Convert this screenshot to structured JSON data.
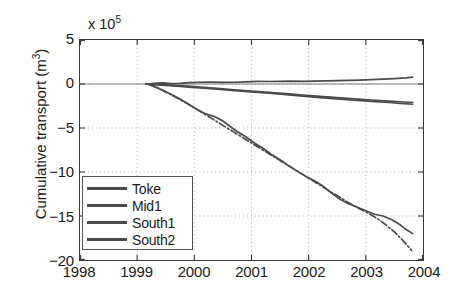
{
  "chart_data": {
    "type": "line",
    "title": "",
    "xlabel": "",
    "ylabel": "Cumulative transport (m3)",
    "ylabel_base": "Cumulative transport (m",
    "ylabel_sup": "3",
    "ylabel_tail": ")",
    "y_multiplier_base": "x 10",
    "y_multiplier_exp": "5",
    "y_multiplier_value": 100000,
    "xlim": [
      1998,
      2004
    ],
    "ylim": [
      -20,
      5
    ],
    "xticks": [
      1998,
      1999,
      2000,
      2001,
      2002,
      2003,
      2004
    ],
    "xticklabels": [
      "1998",
      "1999",
      "2000",
      "2001",
      "2002",
      "2003",
      "2004"
    ],
    "yticks": [
      5,
      0,
      -5,
      -10,
      -15,
      -20
    ],
    "yticklabels": [
      "5",
      "0",
      "-5",
      "-10",
      "-15",
      "-20"
    ],
    "grid": true,
    "grid_style": "dotted",
    "legend_position": "lower left",
    "legend_labels": [
      "Toke",
      "Mid1",
      "South1",
      "South2"
    ],
    "series": [
      {
        "name": "Toke",
        "color": "#4a4a4a",
        "linestyle": "solid",
        "x": [
          1999.15,
          1999.25,
          1999.35,
          1999.45,
          1999.6,
          1999.75,
          1999.9,
          2000.1,
          2000.3,
          2000.5,
          2000.7,
          2000.9,
          2001.1,
          2001.3,
          2001.5,
          2001.7,
          2001.9,
          2002.1,
          2002.3,
          2002.5,
          2002.7,
          2002.9,
          2003.1,
          2003.3,
          2003.5,
          2003.7,
          2003.82
        ],
        "y": [
          0.0,
          0.05,
          0.1,
          0.12,
          0.05,
          0.08,
          0.15,
          0.2,
          0.22,
          0.18,
          0.2,
          0.25,
          0.3,
          0.28,
          0.3,
          0.32,
          0.3,
          0.33,
          0.35,
          0.38,
          0.42,
          0.45,
          0.5,
          0.55,
          0.62,
          0.7,
          0.78
        ]
      },
      {
        "name": "Mid1",
        "color": "#4a4a4a",
        "linestyle": "solid",
        "x": [
          1999.15,
          1999.3,
          1999.5,
          1999.7,
          1999.9,
          2000.1,
          2000.4,
          2000.7,
          2001.0,
          2001.3,
          2001.6,
          2001.9,
          2002.2,
          2002.5,
          2002.8,
          2003.1,
          2003.4,
          2003.6,
          2003.82
        ],
        "y": [
          0.0,
          -0.05,
          -0.1,
          -0.18,
          -0.25,
          -0.35,
          -0.5,
          -0.65,
          -0.8,
          -0.95,
          -1.1,
          -1.25,
          -1.4,
          -1.55,
          -1.7,
          -1.82,
          -1.95,
          -2.02,
          -2.1
        ]
      },
      {
        "name": "South1",
        "color": "#4a4a4a",
        "linestyle": "solid",
        "x": [
          1999.15,
          1999.3,
          1999.5,
          1999.7,
          1999.9,
          2000.1,
          2000.4,
          2000.7,
          2001.0,
          2001.3,
          2001.6,
          2001.9,
          2002.2,
          2002.5,
          2002.8,
          2003.1,
          2003.4,
          2003.6,
          2003.82
        ],
        "y": [
          0.0,
          -0.08,
          -0.15,
          -0.25,
          -0.35,
          -0.45,
          -0.6,
          -0.75,
          -0.9,
          -1.05,
          -1.2,
          -1.38,
          -1.55,
          -1.7,
          -1.85,
          -1.98,
          -2.1,
          -2.2,
          -2.3
        ]
      },
      {
        "name": "South2",
        "color": "#4a4a4a",
        "linestyle": "solid",
        "x": [
          1999.18,
          1999.3,
          1999.45,
          1999.6,
          1999.75,
          1999.9,
          2000.05,
          2000.2,
          2000.35,
          2000.5,
          2000.62,
          2000.75,
          2000.9,
          2001.05,
          2001.2,
          2001.35,
          2001.5,
          2001.65,
          2001.8,
          2001.95,
          2002.1,
          2002.25,
          2002.4,
          2002.55,
          2002.7,
          2002.85,
          2003.0,
          2003.15,
          2003.3,
          2003.45,
          2003.6,
          2003.72,
          2003.82
        ],
        "y": [
          0.0,
          -0.3,
          -0.7,
          -1.2,
          -1.7,
          -2.3,
          -2.9,
          -3.4,
          -3.7,
          -4.2,
          -4.8,
          -5.4,
          -6.0,
          -6.7,
          -7.3,
          -8.0,
          -8.6,
          -9.3,
          -9.9,
          -10.5,
          -11.0,
          -11.6,
          -12.4,
          -13.1,
          -13.6,
          -14.0,
          -14.4,
          -14.8,
          -15.0,
          -15.4,
          -16.0,
          -16.6,
          -17.0
        ]
      },
      {
        "name": "South2-dashdot",
        "color": "#4a4a4a",
        "linestyle": "dashdot",
        "x": [
          1999.2,
          1999.35,
          1999.5,
          1999.7,
          1999.9,
          2000.1,
          2000.3,
          2000.5,
          2000.7,
          2000.9,
          2001.1,
          2001.3,
          2001.5,
          2001.7,
          2001.9,
          2002.1,
          2002.3,
          2002.5,
          2002.7,
          2002.9,
          2003.05,
          2003.2,
          2003.35,
          2003.5,
          2003.65,
          2003.8
        ],
        "y": [
          0.0,
          -0.4,
          -0.9,
          -1.6,
          -2.3,
          -3.1,
          -3.9,
          -4.7,
          -5.5,
          -6.3,
          -7.1,
          -7.9,
          -8.7,
          -9.5,
          -10.3,
          -11.1,
          -11.9,
          -12.7,
          -13.5,
          -14.2,
          -14.7,
          -15.3,
          -16.0,
          -16.8,
          -17.8,
          -18.9
        ]
      }
    ]
  },
  "legend": {
    "items": [
      {
        "label": "Toke"
      },
      {
        "label": "Mid1"
      },
      {
        "label": "South1"
      },
      {
        "label": "South2"
      }
    ]
  }
}
